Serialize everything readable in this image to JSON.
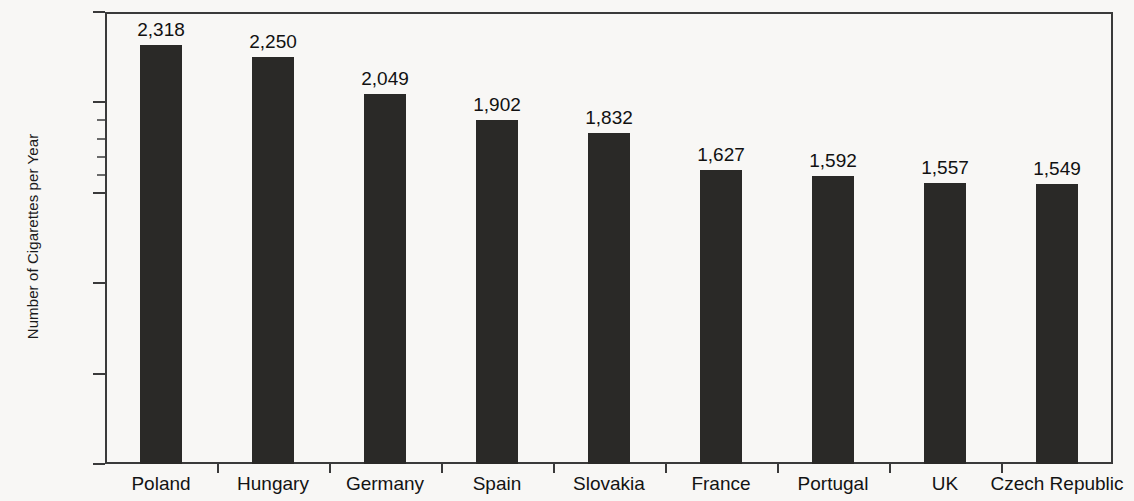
{
  "chart_data": {
    "type": "bar",
    "title": "",
    "subtitle": "",
    "xlabel": "",
    "ylabel": "Number of Cigarettes per Year",
    "categories": [
      "Poland",
      "Hungary",
      "Germany",
      "Spain",
      "Slovakia",
      "France",
      "Portugal",
      "UK",
      "Czech Republic"
    ],
    "values": [
      2318,
      2250,
      2049,
      1902,
      1832,
      1627,
      1592,
      1557,
      1549
    ],
    "value_labels": [
      "2,318",
      "2,250",
      "2,049",
      "1,902",
      "1,832",
      "1,627",
      "1,592",
      "1,557",
      "1,549"
    ],
    "ylim": [
      0,
      2500
    ],
    "ytick_values": [
      0,
      500,
      1000,
      1500,
      2000,
      2500
    ],
    "ytick_labels": [
      "0",
      "500",
      "1,000",
      "1,500",
      "2,000",
      "2,500"
    ],
    "yminor_tick_values": [
      1600,
      1700,
      1800,
      1900
    ],
    "grid": false,
    "legend": null,
    "legend_position": "none",
    "bar_color": "#2a2927",
    "axis_color": "#3a3a3a",
    "background_color": "#f8f7f5",
    "text_color": "#131313"
  },
  "axis": {
    "y_title": "Number of Cigarettes per Year"
  }
}
